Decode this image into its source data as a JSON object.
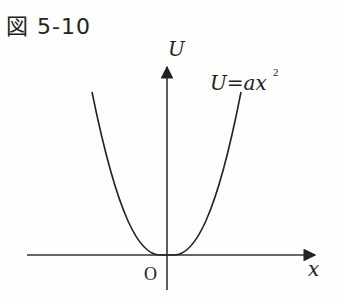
{
  "figure": {
    "title": "図 5-10",
    "y_axis_label": "U",
    "x_axis_label": "x",
    "origin_label": "O",
    "curve_label": "U=ax",
    "curve_label_exponent": "2"
  },
  "colors": {
    "background": "#fdfdfb",
    "ink": "#222222"
  }
}
